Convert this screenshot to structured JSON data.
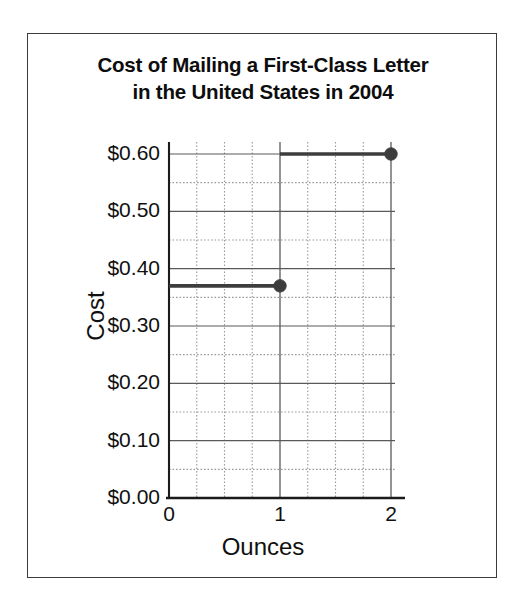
{
  "figure": {
    "background_color": "#ffffff",
    "frame_color": "#3a3a3a"
  },
  "title": {
    "line1": "Cost of Mailing a First-Class Letter",
    "line2": "in the United States in 2004"
  },
  "axes": {
    "x_title": "Ounces",
    "y_title": "Cost"
  },
  "chart_data": {
    "type": "line",
    "title": "Cost of Mailing a First-Class Letter in the United States in 2004",
    "subtitle": "",
    "xlabel": "Ounces",
    "ylabel": "Cost",
    "xlim": [
      0,
      2
    ],
    "ylim": [
      0,
      0.6
    ],
    "grid": true,
    "legend_position": "none",
    "x_ticks": [
      0,
      1,
      2
    ],
    "x_tick_labels": [
      "0",
      "1",
      "2"
    ],
    "x_minor_step": 0.25,
    "y_ticks": [
      0.0,
      0.1,
      0.2,
      0.3,
      0.4,
      0.5,
      0.6
    ],
    "y_tick_labels": [
      "$0.00",
      "$0.10",
      "$0.20",
      "$0.30",
      "$0.40",
      "$0.50",
      "$0.60"
    ],
    "y_minor_step": 0.05,
    "step_function": true,
    "series": [
      {
        "name": "Postage cost",
        "color": "#3d3d3d",
        "segments": [
          {
            "x_start": 0,
            "x_end": 1,
            "y": 0.37,
            "endpoint_x": 1,
            "endpoint_y": 0.37,
            "endpoint_filled": true
          },
          {
            "x_start": 1,
            "x_end": 2,
            "y": 0.6,
            "endpoint_x": 2,
            "endpoint_y": 0.6,
            "endpoint_filled": true
          }
        ],
        "points": [
          {
            "x": 1,
            "y": 0.37,
            "label": "$0.37"
          },
          {
            "x": 2,
            "y": 0.6,
            "label": "$0.60"
          }
        ]
      }
    ]
  }
}
